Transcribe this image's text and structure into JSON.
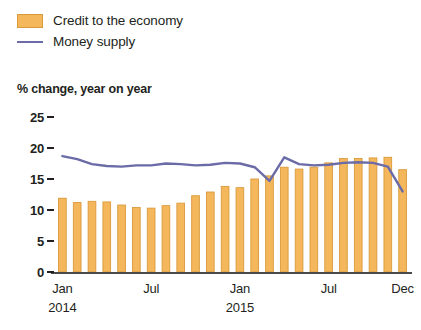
{
  "legend": {
    "items": [
      {
        "label": "Credit to the economy",
        "marker": "bar-swatch",
        "color": "#F5B75C"
      },
      {
        "label": "Money supply",
        "marker": "line-swatch",
        "color": "#6B6BA8"
      }
    ]
  },
  "axis_caption": "% change, year on year",
  "chart_data": {
    "type": "bar",
    "title": "",
    "subtitle": "",
    "xlabel": "",
    "ylabel": "% change, year on year",
    "ylim": [
      0,
      25
    ],
    "yticks": [
      0,
      5,
      10,
      15,
      20,
      25
    ],
    "ytick_labels": [
      "0",
      "5",
      "10",
      "15",
      "20",
      "25"
    ],
    "grid": false,
    "legend_position": "top-left",
    "x": [
      "Jan 2014",
      "Feb 2014",
      "Mar 2014",
      "Apr 2014",
      "May 2014",
      "Jun 2014",
      "Jul 2014",
      "Aug 2014",
      "Sep 2014",
      "Oct 2014",
      "Nov 2014",
      "Dec 2014",
      "Jan 2015",
      "Feb 2015",
      "Mar 2015",
      "Apr 2015",
      "May 2015",
      "Jun 2015",
      "Jul 2015",
      "Aug 2015",
      "Sep 2015",
      "Oct 2015",
      "Nov 2015",
      "Dec 2015"
    ],
    "xtick_labels": [
      "Jan",
      "Jul",
      "Jan",
      "Jul",
      "Dec"
    ],
    "xtick_years": [
      "2014",
      "",
      "2015",
      "",
      ""
    ],
    "xtick_indices": [
      0,
      6,
      12,
      18,
      23
    ],
    "series": [
      {
        "name": "Credit to the economy",
        "type": "bar",
        "color": "#F5B75C",
        "edge_color": "#D99A3C",
        "values": [
          11.9,
          11.2,
          11.4,
          11.3,
          10.8,
          10.4,
          10.3,
          10.7,
          11.1,
          12.3,
          12.9,
          13.8,
          13.6,
          15.0,
          15.5,
          16.9,
          16.6,
          16.9,
          17.6,
          18.3,
          18.3,
          18.4,
          18.5,
          16.5
        ]
      },
      {
        "name": "Money supply",
        "type": "line",
        "color": "#6B6BA8",
        "values": [
          18.7,
          18.2,
          17.4,
          17.1,
          17.0,
          17.2,
          17.2,
          17.5,
          17.4,
          17.2,
          17.3,
          17.6,
          17.5,
          16.9,
          14.7,
          18.5,
          17.4,
          17.2,
          17.3,
          17.6,
          17.7,
          17.6,
          17.0,
          13.0
        ]
      }
    ]
  }
}
